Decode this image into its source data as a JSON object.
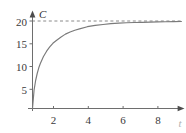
{
  "chart_data": {
    "type": "line",
    "title": "",
    "xlabel": "t",
    "ylabel": "C",
    "xlim": [
      0,
      9.8
    ],
    "ylim": [
      0,
      21.5
    ],
    "grid": false,
    "legend": null,
    "xticks": [
      2,
      4,
      6,
      8
    ],
    "xtick_labels": [
      "2",
      "4",
      "6",
      "8"
    ],
    "yticks": [
      5,
      10,
      15,
      20
    ],
    "ytick_labels": [
      "5",
      "10",
      "15",
      "20"
    ],
    "annotations": [
      {
        "name": "asymptote",
        "type": "hline",
        "y": 20,
        "style": "dashed",
        "label": ""
      }
    ],
    "series": [
      {
        "name": "C",
        "style": "solid",
        "color": "#7a7a7a",
        "x": [
          0,
          0.1,
          0.2,
          0.3,
          0.4,
          0.5,
          0.7,
          0.9,
          1.1,
          1.3,
          1.5,
          1.8,
          2.1,
          2.4,
          2.7,
          3.0,
          3.5,
          4.0,
          4.5,
          5.0,
          5.5,
          6.0,
          6.5,
          7.0,
          7.5,
          8.0,
          8.5,
          9.0,
          9.5
        ],
        "y": [
          0,
          4.2,
          6.4,
          8.0,
          9.3,
          10.3,
          11.9,
          13.1,
          14.1,
          14.9,
          15.5,
          16.3,
          17.0,
          17.5,
          17.9,
          18.2,
          18.7,
          19.0,
          19.2,
          19.4,
          19.5,
          19.6,
          19.65,
          19.7,
          19.75,
          19.8,
          19.82,
          19.85,
          19.88
        ]
      }
    ]
  },
  "axes": {
    "y_name": "C",
    "x_name": "t"
  },
  "labels": {
    "y": [
      "20",
      "15",
      "10",
      "5"
    ],
    "x": [
      "2",
      "4",
      "6",
      "8"
    ]
  },
  "colors": {
    "curve": "#7a7a7a",
    "axis": "#6e6e6e",
    "dash": "#8a8a8a",
    "text": "#3a3a3a"
  }
}
